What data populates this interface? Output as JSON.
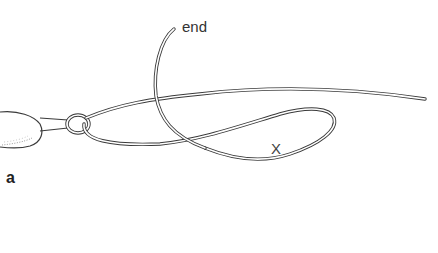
{
  "figure": {
    "panel_label": "a",
    "labels": {
      "end": "end",
      "loop_marker": "X"
    },
    "components": [
      "weight",
      "swivel-ring",
      "main-line",
      "working-end",
      "loop"
    ],
    "colors": {
      "line": "#3a3a3a",
      "background": "#ffffff"
    }
  }
}
